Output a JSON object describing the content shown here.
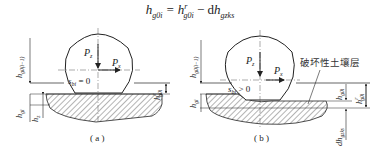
{
  "formula": {
    "lhs": "h",
    "lhs_sub": "g0i",
    "eq": " = ",
    "rhs1": "h",
    "rhs1_sup": "r",
    "rhs1_sub": "g0i",
    "minus": " − d",
    "rhs2": "h",
    "rhs2_sub": "gzks"
  },
  "diagram_a": {
    "caption": "( a )",
    "force_vertical": "P",
    "force_vertical_sub": "z",
    "force_horizontal": "P",
    "force_horizontal_sub": "x",
    "slip_label": "s",
    "slip_sub": "bi",
    "slip_cond": " = 0",
    "left_top_label": "h",
    "left_top_sub": "g0(i−1)",
    "left_mid_label": "h",
    "left_mid_sub": "gi",
    "left_bot_label": "h",
    "left_bot_sub": "z",
    "right_label": "h",
    "right_sup": "r",
    "right_sub": "g0i"
  },
  "diagram_b": {
    "caption": "( b )",
    "force_vertical": "P",
    "force_vertical_sub": "z",
    "force_horizontal": "P",
    "force_horizontal_sub": "x",
    "slip_label": "s",
    "slip_sub": "bi",
    "slip_cond": " > 0",
    "soil_layer_label": "破坏性土壤层",
    "left_top_label": "h",
    "left_top_sub": "g0(i−1)",
    "left_mid_label": "h",
    "left_mid_sub": "gi",
    "right_inner_label": "h",
    "right_inner_sub": "g0i",
    "right_outer_label": "h",
    "right_outer_sup": "r",
    "right_outer_sub": "g0i",
    "bottom_label": "dh",
    "bottom_sub": "gzks"
  }
}
